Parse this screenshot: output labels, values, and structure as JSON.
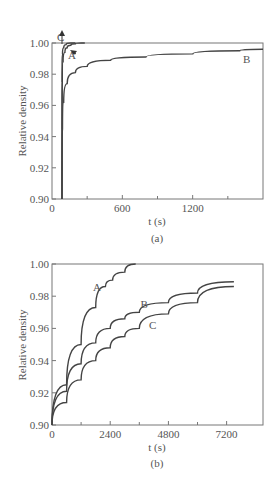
{
  "chart_data": [
    {
      "type": "line",
      "panel_label": "(a)",
      "xlabel": "t (s)",
      "ylabel": "Relative density",
      "xlim": [
        0,
        1800
      ],
      "ylim": [
        0.9,
        1.0
      ],
      "xticks": [
        0,
        600,
        1200
      ],
      "xtick_labels": [
        "0",
        "600",
        "1200"
      ],
      "xminor": [
        300,
        900,
        1500
      ],
      "yticks": [
        0.9,
        0.92,
        0.94,
        0.96,
        0.98,
        1.0
      ],
      "ytick_labels": [
        "0.90",
        "0.92",
        "0.94",
        "0.96",
        "0.98",
        "1.00"
      ],
      "grid": false,
      "series": [
        {
          "name": "A",
          "x": [
            85,
            88,
            95,
            110,
            130,
            160,
            200,
            250,
            280
          ],
          "y": [
            0.9,
            0.975,
            0.988,
            0.994,
            0.997,
            0.9985,
            0.9995,
            1.0,
            1.0
          ]
        },
        {
          "name": "B",
          "x": [
            85,
            90,
            100,
            130,
            200,
            300,
            500,
            800,
            1200,
            1600,
            1800
          ],
          "y": [
            0.9,
            0.945,
            0.962,
            0.974,
            0.981,
            0.985,
            0.989,
            0.991,
            0.993,
            0.995,
            0.996
          ]
        },
        {
          "name": "C",
          "x": [
            85,
            86,
            90,
            100,
            120,
            160,
            200
          ],
          "y": [
            0.9,
            0.985,
            0.993,
            0.997,
            0.999,
            1.0,
            1.0
          ]
        }
      ],
      "annotations": [
        {
          "text": "A",
          "x": 170,
          "y": 0.992
        },
        {
          "text": "B",
          "x": 1660,
          "y": 0.99
        },
        {
          "text": "C",
          "x": 75,
          "y": 1.004
        }
      ]
    },
    {
      "type": "line",
      "panel_label": "(b)",
      "xlabel": "t (s)",
      "ylabel": "Relative density",
      "xlim": [
        0,
        8700
      ],
      "ylim": [
        0.9,
        1.0
      ],
      "xticks": [
        0,
        2400,
        4800,
        7200
      ],
      "xtick_labels": [
        "0",
        "2400",
        "4800",
        "7200"
      ],
      "xminor": [
        1200,
        3600,
        6000
      ],
      "yticks": [
        0.9,
        0.92,
        0.94,
        0.96,
        0.98,
        1.0
      ],
      "ytick_labels": [
        "0.90",
        "0.92",
        "0.94",
        "0.96",
        "0.98",
        "1.00"
      ],
      "grid": false,
      "series": [
        {
          "name": "A",
          "x": [
            0,
            600,
            1200,
            1800,
            2200,
            2500,
            3000,
            3450
          ],
          "y": [
            0.9,
            0.925,
            0.95,
            0.973,
            0.986,
            0.99,
            0.995,
            1.0
          ]
        },
        {
          "name": "B",
          "x": [
            0,
            600,
            1200,
            1800,
            2400,
            3000,
            3600,
            4800,
            6000,
            7500
          ],
          "y": [
            0.9,
            0.921,
            0.938,
            0.951,
            0.96,
            0.966,
            0.97,
            0.976,
            0.982,
            0.989
          ]
        },
        {
          "name": "C",
          "x": [
            0,
            600,
            1200,
            1800,
            2400,
            3000,
            3600,
            4800,
            6000,
            7500
          ],
          "y": [
            0.9,
            0.914,
            0.928,
            0.94,
            0.948,
            0.955,
            0.96,
            0.969,
            0.976,
            0.986
          ]
        }
      ],
      "annotations": [
        {
          "text": "A",
          "x": 1850,
          "y": 0.986
        },
        {
          "text": "B",
          "x": 3800,
          "y": 0.975
        },
        {
          "text": "C",
          "x": 4150,
          "y": 0.962
        }
      ]
    }
  ]
}
